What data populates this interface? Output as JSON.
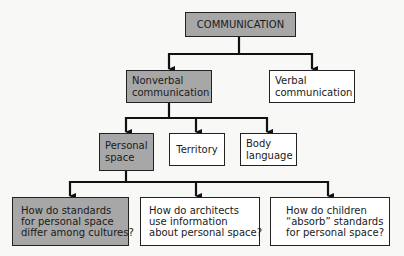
{
  "diagram": {
    "type": "hierarchy",
    "colors": {
      "highlighted_fill": "#a7a7a7",
      "normal_fill": "#ffffff",
      "border": "#222222"
    },
    "root": {
      "label": "COMMUNICATION",
      "highlighted": true
    },
    "level1": [
      {
        "lines": [
          "Nonverbal",
          "communication"
        ],
        "highlighted": true
      },
      {
        "lines": [
          "Verbal",
          "communication"
        ],
        "highlighted": false
      }
    ],
    "level2": [
      {
        "lines": [
          "Personal",
          "space"
        ],
        "highlighted": true
      },
      {
        "lines": [
          "Territory"
        ],
        "highlighted": false
      },
      {
        "lines": [
          "Body",
          "language"
        ],
        "highlighted": false
      }
    ],
    "level3": [
      {
        "lines": [
          "How do standards",
          "for personal space",
          "differ among cultures?"
        ],
        "highlighted": true
      },
      {
        "lines": [
          "How do architects",
          "use information",
          "about personal space?"
        ],
        "highlighted": false
      },
      {
        "lines": [
          "How do children",
          "“absorb” standards",
          "for personal space?"
        ],
        "highlighted": false
      }
    ]
  }
}
